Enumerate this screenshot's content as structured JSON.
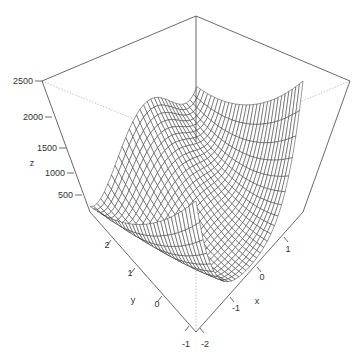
{
  "chart_data": {
    "type": "surface",
    "title": "",
    "function": "Rosenbrock: z = (1 - x)^2 + 100 (y - x^2)^2",
    "xlabel": "x",
    "ylabel": "y",
    "zlabel": "z",
    "xlim": [
      -2,
      2
    ],
    "ylim": [
      -1,
      3
    ],
    "zlim": [
      0,
      2500
    ],
    "x_ticks": [
      "-2",
      "-1",
      "0",
      "1"
    ],
    "y_ticks": [
      "-1",
      "0",
      "1",
      "2"
    ],
    "z_ticks": [
      "500",
      "1000",
      "1500",
      "2000",
      "2500"
    ],
    "grid_lines": 30,
    "line_color": "#333333",
    "box_color": "#444444"
  },
  "axes": {
    "z": {
      "label": "z",
      "ticks": [
        {
          "text": "2500",
          "x": 42,
          "y": 81
        },
        {
          "text": "2000",
          "x": 52,
          "y": 117
        },
        {
          "text": "1500",
          "x": 66,
          "y": 148
        },
        {
          "text": "1000",
          "x": 74,
          "y": 173
        },
        {
          "text": "500",
          "x": 82,
          "y": 195
        }
      ],
      "label_pos": {
        "x": 32,
        "y": 166
      }
    },
    "y": {
      "label": "y",
      "ticks": [
        {
          "text": "2",
          "x": 107,
          "y": 248
        },
        {
          "text": "1",
          "x": 130,
          "y": 276
        },
        {
          "text": "0",
          "x": 157,
          "y": 307
        },
        {
          "text": "-1",
          "x": 186,
          "y": 347
        }
      ],
      "label_pos": {
        "x": 133,
        "y": 303
      }
    },
    "x": {
      "label": "x",
      "ticks": [
        {
          "text": "-2",
          "x": 205,
          "y": 347
        },
        {
          "text": "-1",
          "x": 236,
          "y": 311
        },
        {
          "text": "0",
          "x": 262,
          "y": 280
        },
        {
          "text": "1",
          "x": 288,
          "y": 252
        }
      ],
      "label_pos": {
        "x": 257,
        "y": 304
      }
    }
  }
}
